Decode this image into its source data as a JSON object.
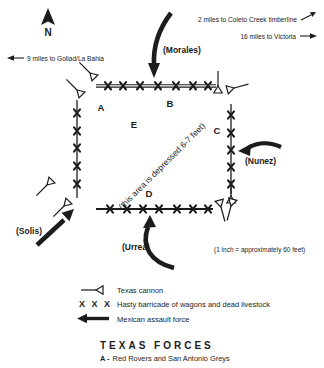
{
  "colors": {
    "ink": "#1c1c1c",
    "background": "#ffffff"
  },
  "compass": {
    "label": "N"
  },
  "distance_notes": {
    "goliad": "9 miles to Goliad/La Bahia",
    "coleto": "2 miles to Coleto Creek timberline",
    "victoria": "16 miles to Victoria"
  },
  "mexican_forces": {
    "morales": "(Morales)",
    "nunez": "(Nunez)",
    "solis": "(Solis)",
    "urrea": "(Urrea)"
  },
  "fort": {
    "position_labels": {
      "a": "A",
      "b": "B",
      "c": "C",
      "d": "D",
      "e": "E"
    },
    "depression_note": "(this area is depressed 6-7 feet)"
  },
  "scale_note": "(1 inch = approximately 60 feet)",
  "legend": {
    "items": [
      {
        "symbol": "texas-cannon",
        "label": "Texas cannon"
      },
      {
        "symbol": "barricade-x",
        "symbol_text": "X X X",
        "label": "Hasty barricade of wagons and dead livestock"
      },
      {
        "symbol": "assault-arrow",
        "label": "Mexican assault force"
      }
    ]
  },
  "texas_forces": {
    "heading": "TEXAS FORCES",
    "entries": [
      {
        "key": "A -",
        "name": "Red Rovers and San Antonio Greys"
      }
    ]
  }
}
